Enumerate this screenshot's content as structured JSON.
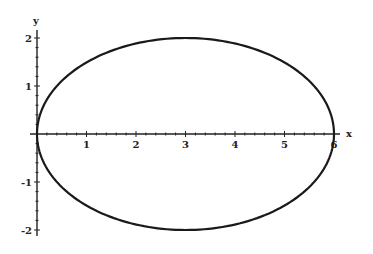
{
  "chart_data": {
    "type": "line",
    "title": "",
    "xlabel": "x",
    "ylabel": "y",
    "xlim": [
      0,
      6.2
    ],
    "ylim": [
      -2.1,
      2.1
    ],
    "grid": false,
    "legend": null,
    "x_ticks": [
      1,
      2,
      3,
      4,
      5,
      6
    ],
    "y_ticks": [
      -2,
      -1,
      1,
      2
    ],
    "x_tick_labels": [
      "1",
      "2",
      "3",
      "4",
      "5",
      "6"
    ],
    "y_tick_labels": [
      "-2",
      "-1",
      "1",
      "2"
    ],
    "series": [
      {
        "name": "ellipse",
        "description": "Ellipse (x-3)^2/9 + y^2/4 = 1",
        "center": [
          3,
          0
        ],
        "semi_axis_x": 3,
        "semi_axis_y": 2,
        "key_points": [
          [
            0,
            0
          ],
          [
            3,
            2
          ],
          [
            6,
            0
          ],
          [
            3,
            -2
          ]
        ],
        "color": "#1a1a1a"
      }
    ]
  }
}
